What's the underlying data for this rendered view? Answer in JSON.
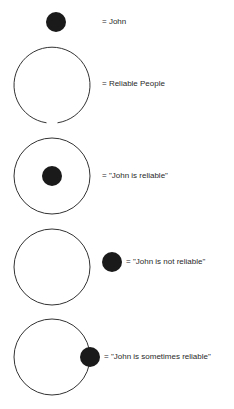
{
  "legend": [
    {
      "id": "john",
      "label": "= John"
    },
    {
      "id": "reliable-people",
      "label": "= Reliable People"
    },
    {
      "id": "john-reliable",
      "label": "= \"John is reliable\""
    },
    {
      "id": "john-not-reliable",
      "label": "= \"John is not reliable\""
    },
    {
      "id": "john-sometimes-reliable",
      "label": "= \"John is sometimes reliable\""
    }
  ],
  "colors": {
    "dot": "#1a1a1a",
    "circle_stroke": "#333333",
    "text": "#2a2a2a"
  }
}
